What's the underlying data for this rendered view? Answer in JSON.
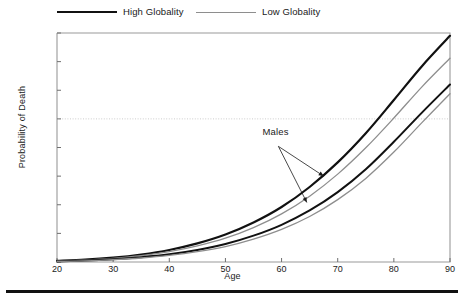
{
  "chart_data": {
    "type": "line",
    "title": "",
    "xlabel": "Age",
    "ylabel": "Probability of Death",
    "xlim": [
      20,
      90
    ],
    "ylim": [
      0.0,
      0.8
    ],
    "xticks": [
      20,
      30,
      40,
      50,
      60,
      70,
      80,
      90
    ],
    "xtick_labels": [
      "20",
      "30",
      "40",
      "50",
      "60",
      "70",
      "80",
      "90"
    ],
    "yticks": [
      0.0,
      0.1,
      0.2,
      0.3,
      0.4,
      0.5,
      0.6,
      0.7,
      0.8
    ],
    "ytick_labels": [
      "0.00",
      "0.10",
      "0.20",
      "0.30",
      "0.40",
      "0.50",
      "0.60",
      "0.70",
      "0.80"
    ],
    "grid": false,
    "legend_position": "top",
    "reference_lines": [
      {
        "name": "probability-half",
        "orientation": "horizontal",
        "value": 0.5,
        "style": "dotted",
        "color": "#cccccc"
      }
    ],
    "annotations": [
      {
        "name": "males-annotation",
        "text": "Males",
        "x": 60.5,
        "y": 0.425,
        "arrows": [
          {
            "to_x": 67.5,
            "to_y": 0.3
          },
          {
            "to_x": 64.5,
            "to_y": 0.208
          }
        ]
      }
    ],
    "x": [
      20,
      25,
      30,
      35,
      40,
      45,
      50,
      55,
      60,
      65,
      70,
      75,
      80,
      85,
      90
    ],
    "series": [
      {
        "name": "Males, High Globality",
        "group": "Males",
        "legend": "High Globality",
        "color": "#111111",
        "width": 2.2,
        "values": [
          0.004,
          0.008,
          0.015,
          0.026,
          0.042,
          0.065,
          0.096,
          0.138,
          0.192,
          0.262,
          0.348,
          0.45,
          0.566,
          0.684,
          0.79
        ]
      },
      {
        "name": "Males, Low Globality",
        "group": "Males",
        "legend": "Low Globality",
        "color": "#8e8e8e",
        "width": 1.3,
        "values": [
          0.003,
          0.007,
          0.013,
          0.022,
          0.036,
          0.056,
          0.083,
          0.12,
          0.168,
          0.23,
          0.307,
          0.399,
          0.503,
          0.612,
          0.712
        ]
      },
      {
        "name": "Females, High Globality",
        "group": "Females",
        "legend": "High Globality",
        "color": "#111111",
        "width": 2.0,
        "values": [
          0.002,
          0.005,
          0.01,
          0.017,
          0.027,
          0.042,
          0.063,
          0.092,
          0.13,
          0.18,
          0.244,
          0.324,
          0.42,
          0.522,
          0.62
        ]
      },
      {
        "name": "Females, Low Globality",
        "group": "Females",
        "legend": "Low Globality",
        "color": "#8e8e8e",
        "width": 1.3,
        "values": [
          0.002,
          0.004,
          0.008,
          0.014,
          0.023,
          0.036,
          0.054,
          0.08,
          0.114,
          0.159,
          0.218,
          0.292,
          0.384,
          0.487,
          0.588
        ]
      }
    ]
  },
  "legend": {
    "entries": [
      {
        "label": "High Globality",
        "color": "#111111",
        "style": "high"
      },
      {
        "label": "Low Globality",
        "color": "#8e8e8e",
        "style": "low"
      }
    ]
  },
  "axes": {
    "x_title": "Age",
    "y_title": "Probability of Death"
  },
  "annotation": {
    "males": "Males"
  },
  "colors": {
    "high_globality": "#111111",
    "low_globality": "#8e8e8e",
    "axis": "#9a9a9a",
    "reference_line": "#cccccc",
    "rule": "#111111"
  }
}
